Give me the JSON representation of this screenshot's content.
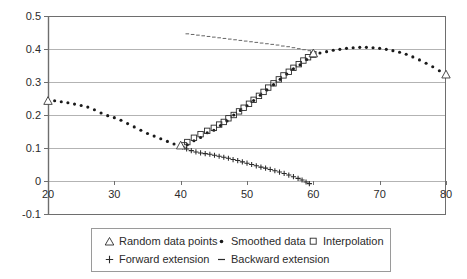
{
  "chart_data": {
    "type": "scatter",
    "title": "",
    "xlabel": "",
    "ylabel": "",
    "xlim": [
      20,
      80
    ],
    "ylim": [
      -0.1,
      0.5
    ],
    "xticks": [
      20,
      30,
      40,
      50,
      60,
      70,
      80
    ],
    "yticks": [
      0.5,
      0.4,
      0.3,
      0.2,
      0.1,
      0,
      -0.1
    ],
    "ytick_labels": [
      "0.5",
      "0.4",
      "0.3",
      "0.2",
      "0.1",
      "0",
      "-0.1"
    ],
    "xtick_labels": [
      "20",
      "30",
      "40",
      "50",
      "60",
      "70",
      "80"
    ],
    "grid": "horizontal",
    "legend_position": "bottom",
    "series": [
      {
        "name": "Random data points",
        "marker": "triangle",
        "color": "#3a3a3a",
        "points": [
          [
            20,
            0.243
          ],
          [
            40,
            0.108
          ],
          [
            60,
            0.387
          ],
          [
            80,
            0.323
          ]
        ]
      },
      {
        "name": "Smoothed data",
        "marker": "dot",
        "color": "#1a1a1a",
        "points": [
          [
            20,
            0.243
          ],
          [
            21,
            0.243
          ],
          [
            22,
            0.24
          ],
          [
            23,
            0.237
          ],
          [
            24,
            0.233
          ],
          [
            25,
            0.229
          ],
          [
            26,
            0.224
          ],
          [
            27,
            0.216
          ],
          [
            28,
            0.206
          ],
          [
            29,
            0.198
          ],
          [
            30,
            0.192
          ],
          [
            31,
            0.184
          ],
          [
            32,
            0.174
          ],
          [
            33,
            0.164
          ],
          [
            34,
            0.154
          ],
          [
            35,
            0.144
          ],
          [
            36,
            0.136
          ],
          [
            37,
            0.128
          ],
          [
            38,
            0.12
          ],
          [
            39,
            0.112
          ],
          [
            40,
            0.106
          ],
          [
            41,
            0.11
          ],
          [
            42,
            0.122
          ],
          [
            43,
            0.132
          ],
          [
            44,
            0.146
          ],
          [
            45,
            0.154
          ],
          [
            46,
            0.168
          ],
          [
            47,
            0.182
          ],
          [
            48,
            0.2
          ],
          [
            49,
            0.214
          ],
          [
            50,
            0.228
          ],
          [
            51,
            0.244
          ],
          [
            52,
            0.26
          ],
          [
            53,
            0.276
          ],
          [
            54,
            0.292
          ],
          [
            55,
            0.308
          ],
          [
            56,
            0.324
          ],
          [
            57,
            0.34
          ],
          [
            58,
            0.352
          ],
          [
            59,
            0.368
          ],
          [
            60,
            0.382
          ],
          [
            61,
            0.388
          ],
          [
            62,
            0.392
          ],
          [
            63,
            0.396
          ],
          [
            64,
            0.399
          ],
          [
            65,
            0.402
          ],
          [
            66,
            0.404
          ],
          [
            67,
            0.405
          ],
          [
            68,
            0.405
          ],
          [
            69,
            0.404
          ],
          [
            70,
            0.402
          ],
          [
            71,
            0.399
          ],
          [
            72,
            0.395
          ],
          [
            73,
            0.39
          ],
          [
            74,
            0.384
          ],
          [
            75,
            0.376
          ],
          [
            76,
            0.367
          ],
          [
            77,
            0.357
          ],
          [
            78,
            0.346
          ],
          [
            79,
            0.334
          ],
          [
            80,
            0.323
          ]
        ]
      },
      {
        "name": "Interpolation",
        "marker": "square",
        "color": "#2b2b2b",
        "points": [
          [
            40.5,
            0.108
          ],
          [
            41,
            0.118
          ],
          [
            42,
            0.131
          ],
          [
            43,
            0.142
          ],
          [
            44,
            0.152
          ],
          [
            45,
            0.161
          ],
          [
            45.8,
            0.171
          ],
          [
            46.5,
            0.179
          ],
          [
            47.2,
            0.19
          ],
          [
            48,
            0.2
          ],
          [
            48.8,
            0.211
          ],
          [
            49.5,
            0.222
          ],
          [
            50.3,
            0.234
          ],
          [
            51,
            0.246
          ],
          [
            51.8,
            0.258
          ],
          [
            52.5,
            0.27
          ],
          [
            53.2,
            0.283
          ],
          [
            54,
            0.296
          ],
          [
            54.8,
            0.308
          ],
          [
            55.5,
            0.32
          ],
          [
            56.3,
            0.331
          ],
          [
            57,
            0.343
          ],
          [
            57.8,
            0.354
          ],
          [
            58.5,
            0.365
          ],
          [
            59.2,
            0.375
          ],
          [
            60,
            0.383
          ]
        ]
      },
      {
        "name": "Forward extension",
        "marker": "plus",
        "color": "#2b2b2b",
        "points": [
          [
            40.3,
            0.103
          ],
          [
            40.9,
            0.097
          ],
          [
            41.6,
            0.092
          ],
          [
            42.3,
            0.088
          ],
          [
            43,
            0.085
          ],
          [
            43.7,
            0.083
          ],
          [
            44.4,
            0.081
          ],
          [
            45.1,
            0.078
          ],
          [
            45.8,
            0.075
          ],
          [
            46.5,
            0.072
          ],
          [
            47.2,
            0.069
          ],
          [
            47.9,
            0.065
          ],
          [
            48.6,
            0.062
          ],
          [
            49.3,
            0.058
          ],
          [
            50,
            0.054
          ],
          [
            50.7,
            0.05
          ],
          [
            51.4,
            0.046
          ],
          [
            52.1,
            0.042
          ],
          [
            52.8,
            0.039
          ],
          [
            53.5,
            0.035
          ],
          [
            54.2,
            0.031
          ],
          [
            54.9,
            0.027
          ],
          [
            55.6,
            0.023
          ],
          [
            56.3,
            0.018
          ],
          [
            57,
            0.013
          ],
          [
            57.7,
            0.008
          ],
          [
            58.3,
            0.003
          ],
          [
            58.9,
            -0.003
          ],
          [
            59.4,
            -0.008
          ]
        ]
      },
      {
        "name": "Backward extension",
        "marker": "dash",
        "color": "#6a6a6a",
        "points": [
          [
            41.0,
            0.446
          ],
          [
            41.8,
            0.444
          ],
          [
            42.6,
            0.442
          ],
          [
            43.4,
            0.44
          ],
          [
            44.2,
            0.438
          ],
          [
            45.0,
            0.436
          ],
          [
            45.8,
            0.434
          ],
          [
            46.6,
            0.432
          ],
          [
            47.4,
            0.43
          ],
          [
            48.2,
            0.428
          ],
          [
            49.0,
            0.426
          ],
          [
            49.8,
            0.424
          ],
          [
            50.6,
            0.422
          ],
          [
            51.4,
            0.42
          ],
          [
            52.2,
            0.418
          ],
          [
            53.0,
            0.416
          ],
          [
            53.8,
            0.414
          ],
          [
            54.6,
            0.412
          ],
          [
            55.4,
            0.409
          ],
          [
            56.2,
            0.407
          ],
          [
            57.0,
            0.404
          ],
          [
            57.8,
            0.401
          ],
          [
            58.6,
            0.398
          ],
          [
            59.4,
            0.395
          ],
          [
            60.2,
            0.392
          ]
        ]
      }
    ]
  },
  "legend": {
    "rows": [
      [
        {
          "label": "Random data points",
          "marker": "triangle-icon"
        },
        {
          "label": "Smoothed data",
          "marker": "dot-icon"
        },
        {
          "label": "Interpolation",
          "marker": "square-icon"
        }
      ],
      [
        {
          "label": "Forward extension",
          "marker": "plus-icon"
        },
        {
          "label": "Backward extension",
          "marker": "dash-icon"
        }
      ]
    ]
  },
  "colors": {
    "axis": "#6e6e6e",
    "grid": "#b3b3b3",
    "marker": "#1a1a1a",
    "background": "#ffffff"
  }
}
